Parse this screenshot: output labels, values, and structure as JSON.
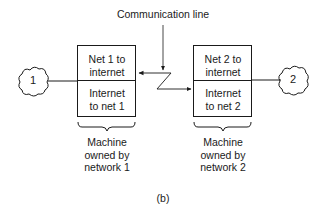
{
  "diagram": {
    "caption": "(b)",
    "communication_line_label": "Communication line",
    "networks": [
      {
        "id": "1",
        "cloud_label": "1",
        "box_top": [
          "Net 1 to",
          "internet"
        ],
        "box_bottom": [
          "Internet",
          "to net 1"
        ],
        "owner_label": [
          "Machine",
          "owned by",
          "network 1"
        ]
      },
      {
        "id": "2",
        "cloud_label": "2",
        "box_top": [
          "Net 2 to",
          "internet"
        ],
        "box_bottom": [
          "Internet",
          "to net 2"
        ],
        "owner_label": [
          "Machine",
          "owned by",
          "network 2"
        ]
      }
    ],
    "colors": {
      "stroke": "#1a1a1a",
      "background": "#ffffff"
    }
  }
}
